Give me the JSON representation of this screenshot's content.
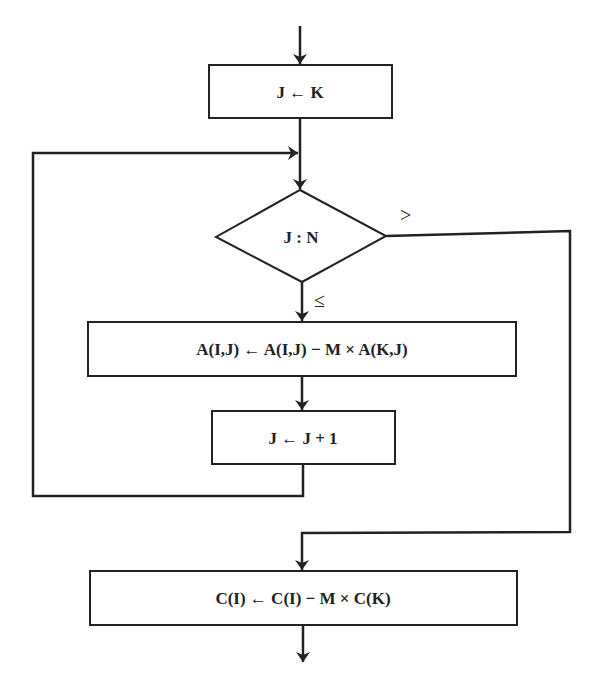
{
  "diagram": {
    "type": "flowchart",
    "stroke_color": "#222222",
    "background": "#ffffff",
    "nodes": [
      {
        "id": "init",
        "shape": "process",
        "label": "J ← K"
      },
      {
        "id": "test",
        "shape": "decision",
        "label": "J : N"
      },
      {
        "id": "update_a",
        "shape": "process",
        "label": "A(I,J) ← A(I,J) − M × A(K,J)"
      },
      {
        "id": "increment",
        "shape": "process",
        "label": "J ← J + 1"
      },
      {
        "id": "update_c",
        "shape": "process",
        "label": "C(I) ← C(I) − M × C(K)"
      }
    ],
    "edges": [
      {
        "from": "entry",
        "to": "init",
        "label": ""
      },
      {
        "from": "init",
        "to": "test",
        "label": ""
      },
      {
        "from": "test",
        "to": "update_a",
        "label": "≤"
      },
      {
        "from": "test",
        "to": "update_c",
        "label": ">"
      },
      {
        "from": "update_a",
        "to": "increment",
        "label": ""
      },
      {
        "from": "increment",
        "to": "test",
        "label": "loop"
      },
      {
        "from": "update_c",
        "to": "exit",
        "label": ""
      }
    ],
    "branch_labels": {
      "greater": ">",
      "less_equal": "≤"
    }
  }
}
